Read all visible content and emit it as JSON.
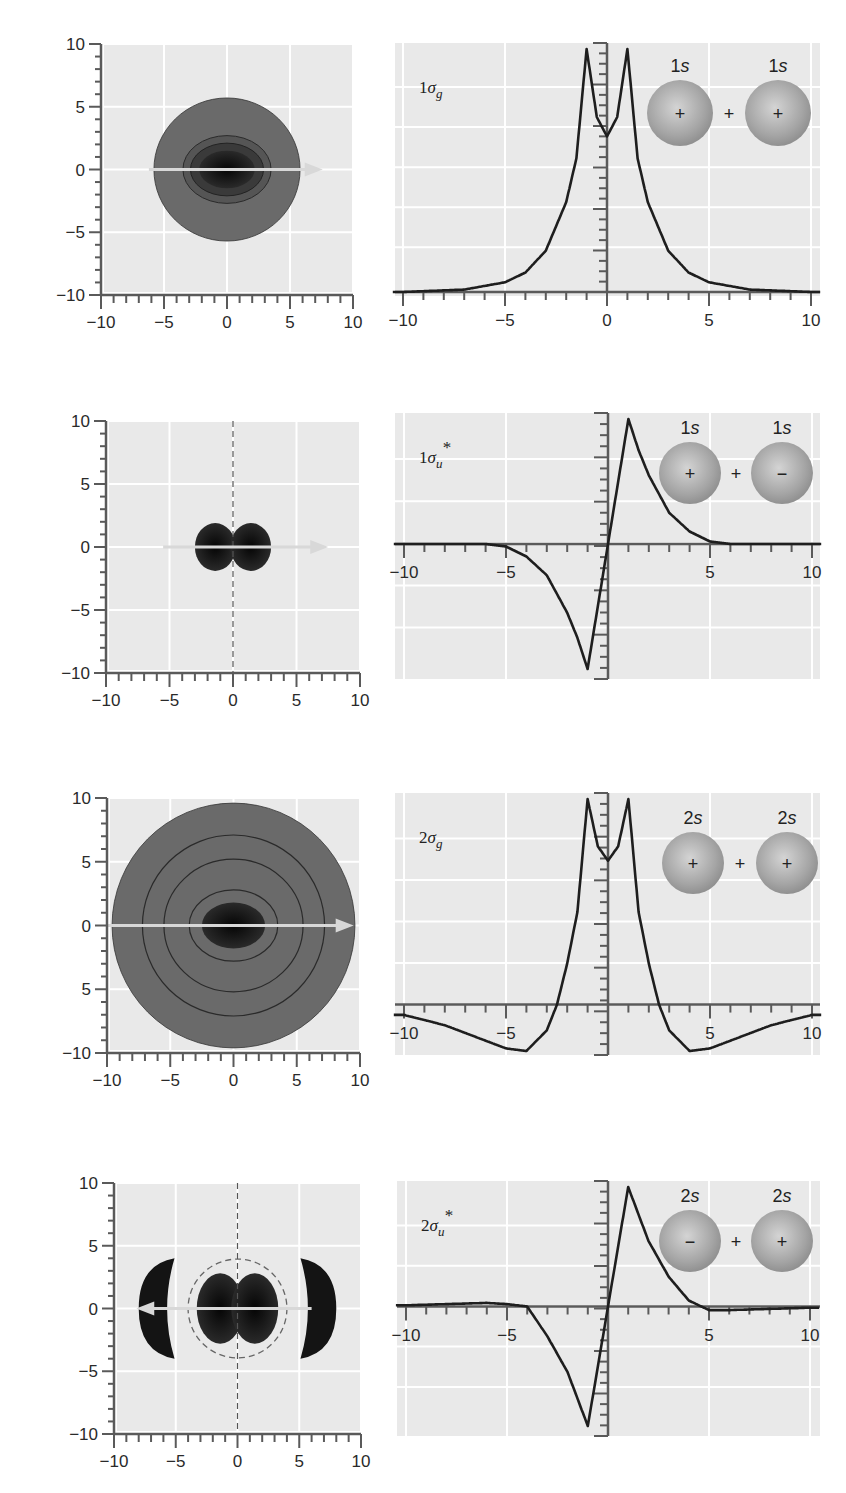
{
  "colors": {
    "plot_bg": "#e9e9e9",
    "grid": "#ffffff",
    "axis": "#5a5a5a",
    "curve": "#1e1e1e",
    "density_outer": "#6a6a6a",
    "density_core": "#141414",
    "arrow": "#d8d8d8",
    "orbital_fill": "#a9a9a9"
  },
  "rows": [
    {
      "name": "1sigma_g",
      "label_num": "1",
      "label_sym": "σ",
      "label_sub": "g",
      "label_star": false,
      "orbitals": [
        {
          "n": "1",
          "l": "s",
          "sign": "+"
        },
        {
          "n": "1",
          "l": "s",
          "sign": "+"
        }
      ],
      "join": "+",
      "contour": {
        "box": [
          101,
          44,
          353,
          295
        ],
        "y_ticks": [
          "10",
          "5",
          "0",
          "−5",
          "−10"
        ],
        "x_ticks": [
          "−10",
          "−5",
          "0",
          "5",
          "10"
        ],
        "dashed_node": false,
        "arrow_dir": "right"
      },
      "profile": {
        "box": [
          395,
          43,
          820,
          296
        ],
        "x0px": 607,
        "x_unit_px": 20.4,
        "baseline_frac": 1.0,
        "x_ticks": [
          "−10",
          "−5",
          "0",
          "5",
          "10"
        ],
        "labels_below": true
      }
    },
    {
      "name": "1sigma_u_star",
      "label_num": "1",
      "label_sym": "σ",
      "label_sub": "u",
      "label_star": true,
      "orbitals": [
        {
          "n": "1",
          "l": "s",
          "sign": "+"
        },
        {
          "n": "1",
          "l": "s",
          "sign": "−"
        }
      ],
      "join": "+",
      "contour": {
        "box": [
          106,
          421,
          360,
          673
        ],
        "y_ticks": [
          "10",
          "5",
          "0",
          "−5",
          "−10"
        ],
        "x_ticks": [
          "−10",
          "−5",
          "0",
          "5",
          "10"
        ],
        "dashed_node": true,
        "arrow_dir": "right"
      },
      "profile": {
        "box": [
          395,
          413,
          820,
          679
        ],
        "x0px": 608,
        "x_unit_px": 20.4,
        "baseline_frac": 0.5,
        "x_ticks": [
          "−10",
          "−5",
          "",
          "5",
          "10"
        ],
        "labels_below": false
      }
    },
    {
      "name": "2sigma_g",
      "label_num": "2",
      "label_sym": "σ",
      "label_sub": "g",
      "label_star": false,
      "orbitals": [
        {
          "n": "2",
          "l": "s",
          "sign": "+"
        },
        {
          "n": "2",
          "l": "s",
          "sign": "+"
        }
      ],
      "join": "+",
      "contour": {
        "box": [
          107,
          798,
          360,
          1053
        ],
        "y_ticks": [
          "10",
          "5",
          "0",
          "5",
          "−10"
        ],
        "x_ticks": [
          "−10",
          "−5",
          "0",
          "5",
          "10"
        ],
        "dashed_node": false,
        "arrow_dir": "right"
      },
      "profile": {
        "box": [
          395,
          793,
          820,
          1055
        ],
        "x0px": 608,
        "x_unit_px": 20.4,
        "baseline_frac": 0.82,
        "x_ticks": [
          "−10",
          "−5",
          "",
          "5",
          "10"
        ],
        "labels_below": false
      }
    },
    {
      "name": "2sigma_u_star",
      "label_num": "2",
      "label_sym": "σ",
      "label_sub": "u",
      "label_star": true,
      "orbitals": [
        {
          "n": "2",
          "l": "s",
          "sign": "−"
        },
        {
          "n": "2",
          "l": "s",
          "sign": "+"
        }
      ],
      "join": "+",
      "contour": {
        "box": [
          114,
          1183,
          361,
          1434
        ],
        "y_ticks": [
          "10",
          "5",
          "0",
          "−5",
          "−10"
        ],
        "x_ticks": [
          "−10",
          "−5",
          "0",
          "5",
          "10"
        ],
        "dashed_node": true,
        "arrow_dir": "left"
      },
      "profile": {
        "box": [
          397,
          1181,
          820,
          1436
        ],
        "x0px": 608,
        "x_unit_px": 20.2,
        "baseline_frac": 0.5,
        "x_ticks": [
          "−10",
          "−5",
          "",
          "5",
          "10"
        ],
        "labels_below": false
      }
    }
  ],
  "chart_data": [
    {
      "type": "line",
      "title": "1σg",
      "xlabel": "",
      "ylabel": "",
      "xlim": [
        -10,
        10
      ],
      "x_ticks": [
        -10,
        -5,
        0,
        5,
        10
      ],
      "grid": true,
      "annotation": "1s + 1s (signs +, +)",
      "x": [
        -10,
        -7,
        -5,
        -4,
        -3,
        -2,
        -1.5,
        -1,
        -0.5,
        0,
        0.5,
        1,
        1.5,
        2,
        3,
        4,
        5,
        7,
        10
      ],
      "values": [
        0.0,
        0.01,
        0.04,
        0.08,
        0.17,
        0.37,
        0.55,
        1.0,
        0.72,
        0.64,
        0.72,
        1.0,
        0.55,
        0.37,
        0.17,
        0.08,
        0.04,
        0.01,
        0.0
      ]
    },
    {
      "type": "line",
      "title": "1σu*",
      "xlabel": "",
      "ylabel": "",
      "xlim": [
        -10,
        10
      ],
      "x_ticks": [
        -10,
        -5,
        5,
        10
      ],
      "grid": true,
      "annotation": "1s + 1s (signs +, −)",
      "x": [
        -10,
        -6,
        -5,
        -4,
        -3,
        -2,
        -1.5,
        -1,
        0,
        1,
        1.5,
        2,
        3,
        4,
        5,
        6,
        10
      ],
      "values": [
        0.0,
        0.0,
        -0.02,
        -0.1,
        -0.25,
        -0.55,
        -0.75,
        -1.0,
        0.0,
        1.0,
        0.75,
        0.55,
        0.25,
        0.1,
        0.02,
        0.0,
        0.0
      ]
    },
    {
      "type": "line",
      "title": "2σg",
      "xlabel": "",
      "ylabel": "",
      "xlim": [
        -10,
        10
      ],
      "x_ticks": [
        -10,
        -5,
        5,
        10
      ],
      "grid": true,
      "annotation": "2s + 2s (signs +, +)",
      "x": [
        -10,
        -8,
        -6,
        -5,
        -4,
        -3,
        -2.5,
        -2,
        -1.5,
        -1,
        -0.5,
        0,
        0.5,
        1,
        1.5,
        2,
        2.5,
        3,
        4,
        5,
        6,
        8,
        10
      ],
      "values": [
        -0.04,
        -0.08,
        -0.14,
        -0.17,
        -0.18,
        -0.1,
        0.0,
        0.2,
        0.45,
        1.0,
        0.77,
        0.7,
        0.77,
        1.0,
        0.45,
        0.2,
        0.0,
        -0.1,
        -0.18,
        -0.17,
        -0.14,
        -0.08,
        -0.04
      ]
    },
    {
      "type": "line",
      "title": "2σu*",
      "xlabel": "",
      "ylabel": "",
      "xlim": [
        -10,
        10
      ],
      "x_ticks": [
        -10,
        -5,
        5,
        10
      ],
      "grid": true,
      "annotation": "2s + 2s (signs −, +)",
      "x": [
        -10,
        -8,
        -6,
        -5,
        -4,
        -3,
        -2,
        -1,
        0,
        1,
        2,
        3,
        4,
        5,
        6,
        8,
        10
      ],
      "values": [
        0.01,
        0.02,
        0.03,
        0.02,
        0.0,
        -0.25,
        -0.55,
        -1.0,
        0.0,
        1.0,
        0.55,
        0.25,
        0.05,
        -0.03,
        -0.03,
        -0.02,
        -0.01
      ]
    },
    {
      "type": "heatmap",
      "title": "1σg electron density contours",
      "xlim": [
        -10,
        10
      ],
      "ylim": [
        -10,
        10
      ],
      "x_ticks": [
        -10,
        -5,
        0,
        5,
        10
      ],
      "y_ticks": [
        10,
        5,
        0,
        -5,
        -10
      ],
      "description": "Single elliptical lobe centered at origin, outer radius ~5.7"
    },
    {
      "type": "heatmap",
      "title": "1σu* electron density contours",
      "xlim": [
        -10,
        10
      ],
      "ylim": [
        -10,
        10
      ],
      "x_ticks": [
        -10,
        -5,
        0,
        5,
        10
      ],
      "y_ticks": [
        10,
        5,
        0,
        -5,
        -10
      ],
      "description": "Two lobes at x≈±1.3 separated by a dashed nodal plane at x=0"
    },
    {
      "type": "heatmap",
      "title": "2σg electron density contours",
      "xlim": [
        -10,
        10
      ],
      "ylim": [
        -10,
        10
      ],
      "x_ticks": [
        -10,
        -5,
        0,
        5,
        10
      ],
      "y_ticks": [
        10,
        5,
        0,
        -5,
        -10
      ],
      "description": "Large disk radius ~9.5 with concentric contours and dense core"
    },
    {
      "type": "heatmap",
      "title": "2σu* electron density contours",
      "xlim": [
        -10,
        10
      ],
      "ylim": [
        -10,
        10
      ],
      "x_ticks": [
        -10,
        -5,
        0,
        5,
        10
      ],
      "y_ticks": [
        10,
        5,
        0,
        -5,
        -10
      ],
      "description": "Two inner lobes, dashed nodal circle r≈4 and nodal plane x=0, two outer crescent lobes at x≈±6.5"
    }
  ]
}
